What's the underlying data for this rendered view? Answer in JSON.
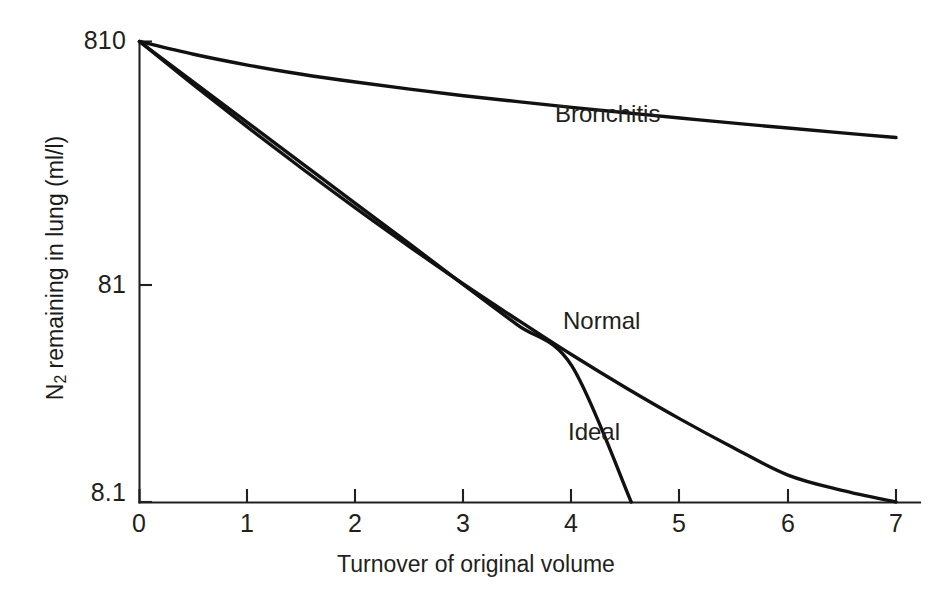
{
  "figure": {
    "background_color": "#ffffff",
    "ink_color": "#231f20"
  },
  "chart_data": {
    "type": "line",
    "title": "",
    "xlabel": "Turnover of original volume",
    "ylabel": "N2 remaining in lung (ml/l)",
    "ylabel_parts": {
      "symbol": "N",
      "subscript": "2",
      "rest": " remaining in lung (ml/l)"
    },
    "yscale": "log",
    "xlim": [
      0,
      7.2
    ],
    "ylim": [
      8.1,
      810
    ],
    "grid": false,
    "legend_position": "inline-annotations",
    "x_ticks": [
      0,
      1,
      2,
      3,
      4,
      5,
      6,
      7
    ],
    "x_tick_labels": [
      "0",
      "1",
      "2",
      "3",
      "4",
      "5",
      "6",
      "7"
    ],
    "y_ticks": [
      810,
      81,
      8.1
    ],
    "y_tick_labels": [
      "810",
      "81",
      "8.1"
    ],
    "series": [
      {
        "name": "Bronchitis",
        "label": "Bronchitis",
        "color": "#111111",
        "x": [
          0,
          0.5,
          1,
          1.5,
          2,
          2.5,
          3,
          3.5,
          4,
          4.5,
          5,
          5.5,
          6,
          6.5,
          7
        ],
        "y": [
          810,
          713,
          640,
          584,
          540,
          503,
          471,
          444,
          419,
          397,
          377,
          358,
          341,
          325,
          310
        ]
      },
      {
        "name": "Normal",
        "label": "Normal",
        "color": "#111111",
        "x": [
          0,
          0.5,
          1,
          1.5,
          2,
          2.5,
          3,
          3.5,
          4,
          4.5,
          5,
          5.5,
          6,
          6.5,
          7
        ],
        "y": [
          810,
          525,
          344,
          228,
          153,
          104,
          71.5,
          50.0,
          35.3,
          25.4,
          18.6,
          13.9,
          10.6,
          9.1,
          8.1
        ]
      },
      {
        "name": "Ideal",
        "label": "Ideal",
        "color": "#111111",
        "x": [
          0,
          0.5,
          1,
          1.5,
          2,
          2.5,
          3,
          3.5,
          4,
          4.55
        ],
        "y": [
          810,
          540,
          360,
          240,
          160,
          107,
          71,
          47.5,
          31.6,
          8.1
        ]
      }
    ],
    "annotations": [
      {
        "name": "bronchitis-label",
        "text": "Bronchitis",
        "x_px": 555,
        "y_px": 103
      },
      {
        "name": "normal-label",
        "text": "Normal",
        "x_px": 563,
        "y_px": 310
      },
      {
        "name": "ideal-label",
        "text": "Ideal",
        "x_px": 568,
        "y_px": 421
      }
    ]
  }
}
